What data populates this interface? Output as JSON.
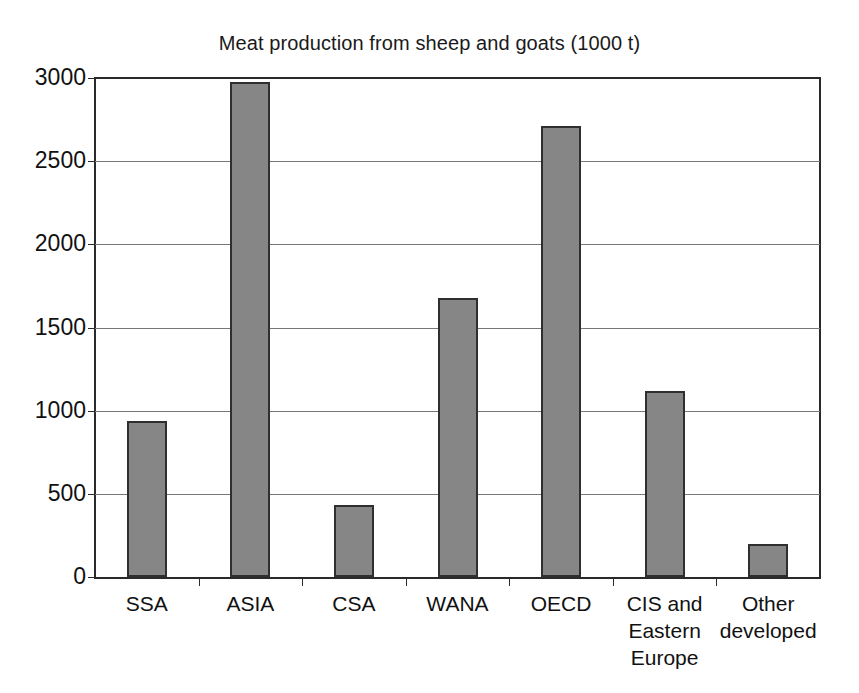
{
  "chart_data": {
    "type": "bar",
    "title": "Meat production from sheep and goats (1000 t)",
    "xlabel": "",
    "ylabel": "",
    "categories": [
      "SSA",
      "ASIA",
      "CSA",
      "WANA",
      "OECD",
      "CIS and Eastern Europe",
      "Other developed"
    ],
    "category_lines": [
      [
        "SSA"
      ],
      [
        "ASIA"
      ],
      [
        "CSA"
      ],
      [
        "WANA"
      ],
      [
        "OECD"
      ],
      [
        "CIS and",
        "Eastern",
        "Europe"
      ],
      [
        "Other",
        "developed"
      ]
    ],
    "values": [
      935,
      2975,
      435,
      1675,
      2710,
      1120,
      200
    ],
    "ylim": [
      0,
      3000
    ],
    "yticks": [
      0,
      500,
      1000,
      1500,
      2000,
      2500,
      3000
    ],
    "ytick_labels": [
      "0",
      "500",
      "1000",
      "1500",
      "2000",
      "2500",
      "3000"
    ],
    "grid": true,
    "legend": false,
    "bar_color": "#868686",
    "bar_edge_color": "#2f2f2f",
    "axis_color": "#2a2a2a",
    "gridline_color": "#777777"
  },
  "caption": {
    "cropped_text": "        "
  }
}
